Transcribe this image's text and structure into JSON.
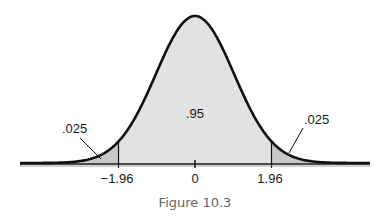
{
  "chart_data": {
    "type": "area",
    "distribution": "standard normal",
    "x_range": [
      -4.5,
      4.5
    ],
    "critical_values": [
      -1.96,
      1.96
    ],
    "center_tick": 0,
    "tick_labels": [
      "−1.96",
      "0",
      "1.96"
    ],
    "regions": [
      {
        "name": "left-tail",
        "from": -4.5,
        "to": -1.96,
        "area_label": ".025"
      },
      {
        "name": "center",
        "from": -1.96,
        "to": 1.96,
        "area_label": ".95"
      },
      {
        "name": "right-tail",
        "from": 1.96,
        "to": 4.5,
        "area_label": ".025"
      }
    ],
    "caption": "Figure 10.3",
    "colors": {
      "center_fill": "#e2e2e2",
      "tail_fill": "#c9c9c9",
      "curve": "#111111"
    }
  }
}
